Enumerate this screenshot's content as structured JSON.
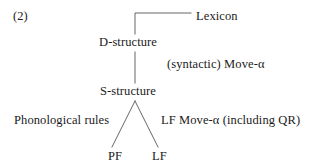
{
  "figure": {
    "item_number": "(2)",
    "kind": "linguistics-derivation-tree",
    "line_color": "#55555a",
    "text_color": "#1b1b1b",
    "background": "#ffffff"
  },
  "nodes": {
    "lexicon": "Lexicon",
    "d_structure": "D-structure",
    "s_structure": "S-structure",
    "pf": "PF",
    "lf": "LF"
  },
  "edge_labels": {
    "syntactic_move": "(syntactic) Move-α",
    "phonological_rules": "Phonological rules",
    "lf_move": "LF Move-α  (including QR)"
  }
}
